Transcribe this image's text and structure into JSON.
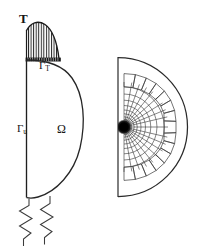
{
  "figure": {
    "type": "engineering-diagram",
    "panels": [
      {
        "id": "domain-panel",
        "name": "boundary-value-problem",
        "position": "left",
        "shape": "half-disk with flat vertical left edge",
        "labels": [
          {
            "key": "traction",
            "text": "T",
            "style": "bold",
            "meaning": "applied traction load"
          },
          {
            "key": "gamma_t",
            "text": "Γ",
            "subscript": "T",
            "meaning": "traction boundary"
          },
          {
            "key": "gamma_u",
            "text": "Γ",
            "subscript": "u",
            "meaning": "displacement boundary"
          },
          {
            "key": "omega",
            "text": "Ω",
            "meaning": "domain interior"
          }
        ],
        "features": [
          "hatched traction distribution profile at top",
          "thick dark band marking the loaded boundary segment",
          "two zigzag spring supports at the bottom"
        ]
      },
      {
        "id": "mesh-panel",
        "name": "finite-element-mesh",
        "position": "right",
        "shape": "half-disk with flat vertical left edge",
        "features": [
          "polar graded quadrilateral mesh",
          "strong refinement converging to a dark singular point on the flat edge",
          "outer band of larger rotated quadrilateral cells"
        ]
      }
    ],
    "labels": {
      "traction_T": "T",
      "gamma_base": "Γ",
      "gamma_t_sub": "T",
      "gamma_u_sub": "u",
      "omega": "Ω"
    },
    "colors": {
      "ink": "#151515",
      "line": "#2a2a2a",
      "mesh_line": "#333333",
      "background": "#ffffff",
      "singularity": "#000000"
    }
  }
}
